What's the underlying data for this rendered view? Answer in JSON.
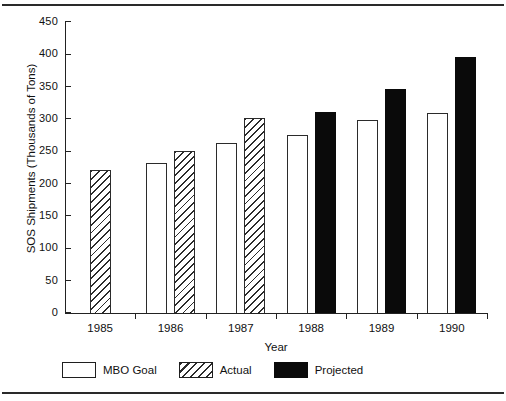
{
  "chart_data": {
    "type": "bar",
    "title": "",
    "xlabel": "Year",
    "ylabel": "SOS Shipments (Thousands of Tons)",
    "categories": [
      "1985",
      "1986",
      "1987",
      "1988",
      "1989",
      "1990"
    ],
    "ylim": [
      0,
      450
    ],
    "yticks": [
      0,
      50,
      100,
      150,
      200,
      250,
      300,
      350,
      400,
      450
    ],
    "ytick_labels": [
      "0",
      "50",
      "100",
      "150",
      "200",
      "250",
      "300",
      "350",
      "400",
      "450"
    ],
    "grid": false,
    "legend_position": "below-axes-left",
    "series": [
      {
        "name": "MBO Goal",
        "style": "open-white",
        "color": "#ffffff",
        "values": [
          null,
          232,
          263,
          275,
          299,
          310
        ]
      },
      {
        "name": "Actual",
        "style": "diagonal-hatch",
        "color": "#2b2b2b",
        "values": [
          221,
          251,
          302,
          null,
          null,
          null
        ]
      },
      {
        "name": "Projected",
        "style": "solid-black",
        "color": "#0a0a0a",
        "values": [
          null,
          null,
          null,
          311,
          346,
          396
        ]
      }
    ]
  },
  "legend": {
    "items": [
      {
        "label": "MBO Goal",
        "swatch": "open-white-swatch"
      },
      {
        "label": "Actual",
        "swatch": "diagonal-hatch-swatch"
      },
      {
        "label": "Projected",
        "swatch": "solid-black-swatch"
      }
    ]
  }
}
